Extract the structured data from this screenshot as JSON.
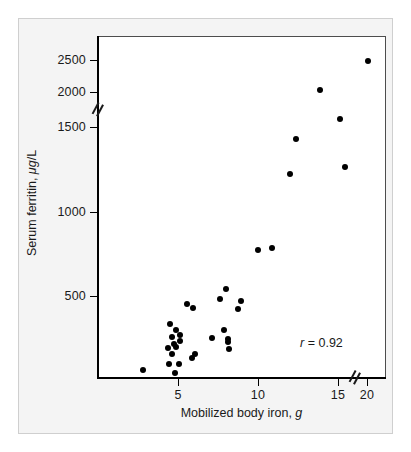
{
  "chart_data": {
    "type": "scatter",
    "title": "",
    "xlabel": "Mobilized body iron, g",
    "xlabel_plain": "Mobilized body iron,",
    "xlabel_italic": "g",
    "ylabel": "Serum ferritin, μg/L",
    "ylabel_plain_1": "Serum ferritin, ",
    "ylabel_italic": "μg",
    "ylabel_plain_2": "/L",
    "xlim": [
      1.5,
      21
    ],
    "ylim": [
      0,
      2700
    ],
    "xticks": [
      5,
      10,
      15,
      20
    ],
    "xticklabels": [
      "5",
      "10",
      "15",
      "20"
    ],
    "yticks": [
      500,
      1000,
      1500,
      2000,
      2500
    ],
    "yticklabels": [
      "500",
      "1000",
      "1500",
      "2000",
      "2500"
    ],
    "grid": false,
    "legend": false,
    "axis_breaks": {
      "y_axis_break_between": [
        1500,
        2000
      ],
      "x_axis_break_between": [
        15,
        20
      ]
    },
    "annotations": [
      {
        "name": "correlation",
        "text": "r = 0.92",
        "symbol": "r",
        "operator": "=",
        "value": "0.92",
        "position": "bottom-right"
      }
    ],
    "marker": {
      "shape": "circle",
      "color": "#000000",
      "size_px": 6
    },
    "points": [
      {
        "x": 2.8,
        "y": 60
      },
      {
        "x": 4.35,
        "y": 190
      },
      {
        "x": 4.5,
        "y": 335
      },
      {
        "x": 4.45,
        "y": 95
      },
      {
        "x": 4.6,
        "y": 155
      },
      {
        "x": 4.6,
        "y": 255
      },
      {
        "x": 4.75,
        "y": 215
      },
      {
        "x": 4.8,
        "y": 40
      },
      {
        "x": 4.85,
        "y": 300
      },
      {
        "x": 4.9,
        "y": 195
      },
      {
        "x": 5.05,
        "y": 95
      },
      {
        "x": 5.1,
        "y": 230
      },
      {
        "x": 5.15,
        "y": 265
      },
      {
        "x": 5.55,
        "y": 455
      },
      {
        "x": 5.85,
        "y": 130
      },
      {
        "x": 5.95,
        "y": 430
      },
      {
        "x": 6.05,
        "y": 155
      },
      {
        "x": 7.1,
        "y": 250
      },
      {
        "x": 7.65,
        "y": 485
      },
      {
        "x": 7.85,
        "y": 300
      },
      {
        "x": 8.0,
        "y": 540
      },
      {
        "x": 8.1,
        "y": 245
      },
      {
        "x": 8.15,
        "y": 225
      },
      {
        "x": 8.2,
        "y": 185
      },
      {
        "x": 8.75,
        "y": 420
      },
      {
        "x": 8.95,
        "y": 470
      },
      {
        "x": 10.0,
        "y": 775
      },
      {
        "x": 10.9,
        "y": 785
      },
      {
        "x": 12.0,
        "y": 1225
      },
      {
        "x": 12.35,
        "y": 1430
      },
      {
        "x": 13.9,
        "y": 2030
      },
      {
        "x": 15.3,
        "y": 1620
      },
      {
        "x": 16.2,
        "y": 1265
      },
      {
        "x": 20.1,
        "y": 2490
      }
    ]
  },
  "axis_geometry": {
    "plot_left_px": 97,
    "plot_right_px": 385,
    "plot_top_px": 37,
    "plot_bottom_px": 378,
    "x_tick_px": {
      "5": 178,
      "10": 258,
      "15": 338,
      "20": 367
    },
    "y_tick_px": {
      "500": 296,
      "1000": 212,
      "1500": 127,
      "2000": 92,
      "2500": 60
    }
  },
  "colors": {
    "marker": "#000000",
    "axis": "#000000",
    "text": "#1a1a1a",
    "figure_background": "#f4f4f4",
    "plot_background": "#ffffff",
    "frame_border": "#cfcfcf"
  }
}
